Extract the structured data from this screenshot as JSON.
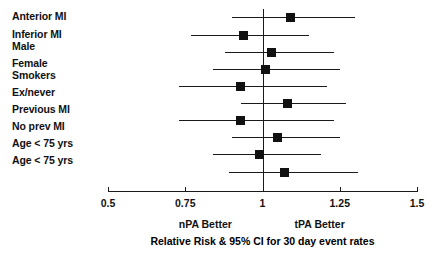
{
  "chart_data": {
    "type": "scatter",
    "subtype": "forest-plot",
    "title": "Relative Risk & 95% CI for 30 day event rates",
    "xlabel": "Relative Risk",
    "ylabel": "",
    "xlim": [
      0.5,
      1.5
    ],
    "xticks": [
      0.5,
      0.75,
      1.0,
      1.25,
      1.5
    ],
    "xtick_labels": [
      "0.5",
      "0.75",
      "1",
      "1.25",
      "1.5"
    ],
    "grid": false,
    "reference_line": 1.0,
    "left_annotation": "nPA Better",
    "right_annotation": "tPA Better",
    "categories": [
      "Anterior MI",
      "Inferior MI",
      "Male",
      "Female",
      "Smokers",
      "Ex/never",
      "Previous MI",
      "No prev MI",
      "Age < 75 yrs",
      "Age < 75 yrs"
    ],
    "estimates": [
      1.09,
      0.94,
      1.03,
      1.01,
      0.93,
      1.08,
      0.93,
      1.05,
      0.99,
      1.07
    ],
    "ci_low": [
      0.9,
      0.77,
      0.88,
      0.84,
      0.73,
      0.93,
      0.73,
      0.9,
      0.84,
      0.89
    ],
    "ci_high": [
      1.3,
      1.15,
      1.23,
      1.25,
      1.21,
      1.27,
      1.23,
      1.25,
      1.19,
      1.31
    ],
    "points": [
      {
        "label": "Anterior MI",
        "estimate": 1.09,
        "ci_low": 0.9,
        "ci_high": 1.3
      },
      {
        "label": "Inferior MI",
        "estimate": 0.94,
        "ci_low": 0.77,
        "ci_high": 1.15
      },
      {
        "label": "Male",
        "estimate": 1.03,
        "ci_low": 0.88,
        "ci_high": 1.23
      },
      {
        "label": "Female",
        "estimate": 1.01,
        "ci_low": 0.84,
        "ci_high": 1.25
      },
      {
        "label": "Smokers",
        "estimate": 0.93,
        "ci_low": 0.73,
        "ci_high": 1.21
      },
      {
        "label": "Ex/never",
        "estimate": 1.08,
        "ci_low": 0.93,
        "ci_high": 1.27
      },
      {
        "label": "Previous MI",
        "estimate": 0.93,
        "ci_low": 0.73,
        "ci_high": 1.23
      },
      {
        "label": "No prev MI",
        "estimate": 1.05,
        "ci_low": 0.9,
        "ci_high": 1.25
      },
      {
        "label": "Age < 75 yrs",
        "estimate": 0.99,
        "ci_low": 0.84,
        "ci_high": 1.19
      },
      {
        "label": "Age < 75 yrs",
        "estimate": 1.07,
        "ci_low": 0.89,
        "ci_high": 1.31
      }
    ],
    "marker_color": "#111111",
    "line_color": "#1a1a1a"
  }
}
